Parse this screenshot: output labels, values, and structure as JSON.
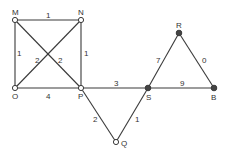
{
  "graph": {
    "nodes": [
      {
        "id": "M",
        "label": "M",
        "x": 15,
        "y": 20,
        "style": "open",
        "lx": 12,
        "ly": 15
      },
      {
        "id": "N",
        "label": "N",
        "x": 81,
        "y": 20,
        "style": "open",
        "lx": 78,
        "ly": 15
      },
      {
        "id": "O",
        "label": "O",
        "x": 15,
        "y": 88,
        "style": "open",
        "lx": 12,
        "ly": 99
      },
      {
        "id": "P",
        "label": "P",
        "x": 81,
        "y": 88,
        "style": "open",
        "lx": 78,
        "ly": 99
      },
      {
        "id": "S",
        "label": "S",
        "x": 148,
        "y": 88,
        "style": "filled",
        "lx": 146,
        "ly": 100
      },
      {
        "id": "R",
        "label": "R",
        "x": 179,
        "y": 33,
        "style": "filled",
        "lx": 176,
        "ly": 28
      },
      {
        "id": "B",
        "label": "B",
        "x": 214,
        "y": 88,
        "style": "filled",
        "lx": 211,
        "ly": 100
      },
      {
        "id": "Q",
        "label": "Q",
        "x": 116,
        "y": 142,
        "style": "open",
        "lx": 121,
        "ly": 146
      }
    ],
    "edges": [
      {
        "from": "M",
        "to": "N",
        "weight": "1",
        "wx": 46,
        "wy": 18
      },
      {
        "from": "M",
        "to": "O",
        "weight": "1",
        "wx": 17,
        "wy": 56
      },
      {
        "from": "N",
        "to": "P",
        "weight": "1",
        "wx": 84,
        "wy": 56
      },
      {
        "from": "M",
        "to": "P",
        "weight": "2",
        "wx": 58,
        "wy": 63
      },
      {
        "from": "N",
        "to": "O",
        "weight": "2",
        "wx": 35,
        "wy": 63
      },
      {
        "from": "O",
        "to": "P",
        "weight": "4",
        "wx": 46,
        "wy": 99
      },
      {
        "from": "P",
        "to": "S",
        "weight": "3",
        "wx": 114,
        "wy": 86
      },
      {
        "from": "S",
        "to": "B",
        "weight": "9",
        "wx": 180,
        "wy": 86
      },
      {
        "from": "S",
        "to": "R",
        "weight": "7",
        "wx": 156,
        "wy": 63
      },
      {
        "from": "R",
        "to": "B",
        "weight": "0",
        "wx": 202,
        "wy": 63
      },
      {
        "from": "P",
        "to": "Q",
        "weight": "2",
        "wx": 93,
        "wy": 122
      },
      {
        "from": "S",
        "to": "Q",
        "weight": "1",
        "wx": 135,
        "wy": 122
      }
    ]
  }
}
